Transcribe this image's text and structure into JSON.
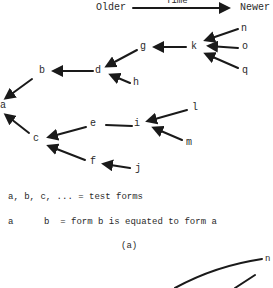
{
  "header": {
    "older_label": "Older",
    "time_label": "Time",
    "newer_label": "Newer"
  },
  "nodes": {
    "a": "a",
    "b": "b",
    "c": "c",
    "d": "d",
    "e": "e",
    "f": "f",
    "g": "g",
    "h": "h",
    "i": "i",
    "j": "j",
    "k": "k",
    "l": "l",
    "m": "m",
    "n": "n",
    "o": "o",
    "q": "q"
  },
  "edges": [
    {
      "from": "b",
      "to": "a",
      "arrow": true
    },
    {
      "from": "c",
      "to": "a",
      "arrow": true
    },
    {
      "from": "d",
      "to": "b",
      "arrow": true
    },
    {
      "from": "g",
      "to": "d",
      "arrow": true
    },
    {
      "from": "h",
      "to": "d",
      "arrow": true
    },
    {
      "from": "k",
      "to": "g",
      "arrow": true
    },
    {
      "from": "n",
      "to": "k",
      "arrow": true
    },
    {
      "from": "o",
      "to": "k",
      "arrow": true
    },
    {
      "from": "q",
      "to": "k",
      "arrow": true
    },
    {
      "from": "e",
      "to": "c",
      "arrow": true
    },
    {
      "from": "f",
      "to": "c",
      "arrow": true
    },
    {
      "from": "i",
      "to": "e",
      "arrow": false
    },
    {
      "from": "l",
      "to": "i",
      "arrow": true
    },
    {
      "from": "m",
      "to": "i",
      "arrow": true
    },
    {
      "from": "j",
      "to": "f",
      "arrow": true
    }
  ],
  "legend": {
    "line1": "a, b, c, ... = test forms",
    "line2_left": "a",
    "line2_right": "b  = form b is equated to form a"
  },
  "caption": "(a)",
  "partial_figure": {
    "node_n": "n"
  }
}
